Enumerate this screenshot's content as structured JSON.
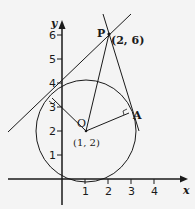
{
  "diagram": {
    "type": "geometry-coordinate",
    "axes": {
      "x_label": "x",
      "y_label": "y",
      "x_ticks": [
        "1",
        "2",
        "3",
        "4"
      ],
      "y_ticks": [
        "1",
        "2",
        "3",
        "4",
        "5",
        "6"
      ]
    },
    "points": {
      "P": {
        "label": "P",
        "coords": "(2, 6)"
      },
      "O": {
        "label": "O",
        "coords": "(1, 2)"
      },
      "A": {
        "label": "A"
      }
    },
    "circle": {
      "center": "O"
    },
    "colors": {
      "ink": "#1a1a1a",
      "background": "#f4f4f4"
    }
  }
}
